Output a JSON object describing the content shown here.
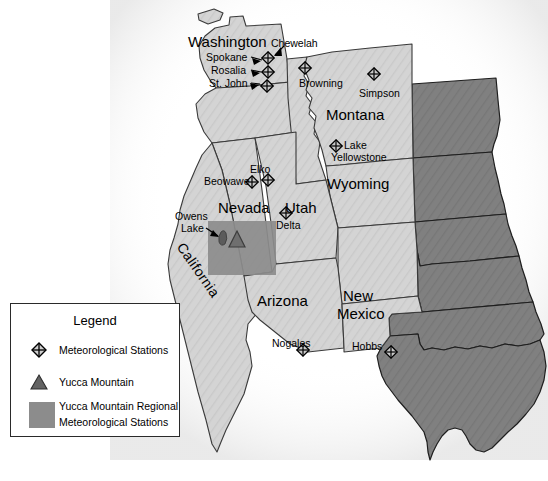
{
  "figure": {
    "type": "map",
    "region": "Western United States",
    "background_color": "#ffffff"
  },
  "colors": {
    "western_states_fill": "#d2d2d2",
    "eastern_states_fill": "#7e7e7e",
    "regional_box_fill": "#8c8c8c",
    "border_stroke": "#000000",
    "state_line_stroke": "#3a3a3a",
    "marker_stroke": "#000000",
    "yucca_triangle_fill": "#6a6a6a",
    "halo_fill": "#f2f2f2"
  },
  "state_labels": [
    {
      "name": "Washington",
      "x": 188,
      "y": 34,
      "size": "big"
    },
    {
      "name": "Montana",
      "x": 326,
      "y": 107,
      "size": "big"
    },
    {
      "name": "Wyoming",
      "x": 327,
      "y": 176,
      "size": "big"
    },
    {
      "name": "Nevada",
      "x": 218,
      "y": 200,
      "size": "big"
    },
    {
      "name": "Utah",
      "x": 285,
      "y": 200,
      "size": "big"
    },
    {
      "name": "Arizona",
      "x": 257,
      "y": 293,
      "size": "big"
    },
    {
      "name": "New",
      "x": 343,
      "y": 288,
      "size": "big"
    },
    {
      "name": "Mexico",
      "x": 337,
      "y": 306,
      "size": "big"
    }
  ],
  "california_label": {
    "name": "California",
    "x": 186,
    "y": 240
  },
  "stations": [
    {
      "name": "Chewelah",
      "label_x": 271,
      "label_y": 38,
      "marker_x": 268,
      "marker_y": 60,
      "label_align": "left",
      "cluster": true
    },
    {
      "name": "Spokane",
      "label_x": 206,
      "label_y": 52,
      "marker_x": 268,
      "marker_y": 60,
      "label_align": "left",
      "cluster": true
    },
    {
      "name": "Rosalia",
      "label_x": 211,
      "label_y": 65,
      "marker_x": 268,
      "marker_y": 72,
      "label_align": "left",
      "cluster": true
    },
    {
      "name": "St. John",
      "label_x": 209,
      "label_y": 78,
      "marker_x": 268,
      "marker_y": 84,
      "label_align": "left",
      "cluster": true
    },
    {
      "name": "Browning",
      "label_x": 299,
      "label_y": 78,
      "marker_x": 305,
      "marker_y": 68,
      "label_align": "left",
      "cluster": false
    },
    {
      "name": "Simpson",
      "label_x": 359,
      "label_y": 88,
      "marker_x": 374,
      "marker_y": 74,
      "label_align": "left",
      "cluster": false
    },
    {
      "name": "Lake",
      "label_x": 344,
      "label_y": 141,
      "marker_x": 335,
      "marker_y": 146,
      "label_align": "left",
      "cluster": false
    },
    {
      "name": "Yellowstone",
      "label_x": 331,
      "label_y": 153,
      "marker_x": 335,
      "marker_y": 146,
      "label_align": "left",
      "cluster": false
    },
    {
      "name": "Elko",
      "label_x": 250,
      "label_y": 164,
      "marker_x": 268,
      "marker_y": 180,
      "label_align": "left",
      "cluster": false
    },
    {
      "name": "Beowawe",
      "label_x": 204,
      "label_y": 176,
      "marker_x": 253,
      "marker_y": 181,
      "label_align": "left",
      "cluster": false
    },
    {
      "name": "Delta",
      "label_x": 276,
      "label_y": 225,
      "marker_x": 286,
      "marker_y": 213,
      "label_align": "left",
      "cluster": false
    },
    {
      "name": "Nogales",
      "label_x": 272,
      "label_y": 339,
      "marker_x": 303,
      "marker_y": 350,
      "label_align": "left",
      "cluster": false
    },
    {
      "name": "Hobbs",
      "label_x": 352,
      "label_y": 341,
      "marker_x": 391,
      "marker_y": 352,
      "label_align": "left",
      "cluster": false
    }
  ],
  "owens_lake": {
    "name_line1": "Owens",
    "name_line2": "Lake",
    "x": 178,
    "y": 212
  },
  "yucca_mountain": {
    "marker_x": 237,
    "marker_y": 239
  },
  "regional_box": {
    "x": 208,
    "y": 221,
    "width": 68,
    "height": 54
  },
  "legend": {
    "title": "Legend",
    "items": [
      {
        "icon": "diamond-cross-icon",
        "label": "Meteorological Stations"
      },
      {
        "icon": "triangle-icon",
        "label": "Yucca Mountain"
      },
      {
        "icon": "gray-swatch-icon",
        "label_line1": "Yucca Mountain Regional",
        "label_line2": "Meteorological Stations"
      }
    ]
  }
}
